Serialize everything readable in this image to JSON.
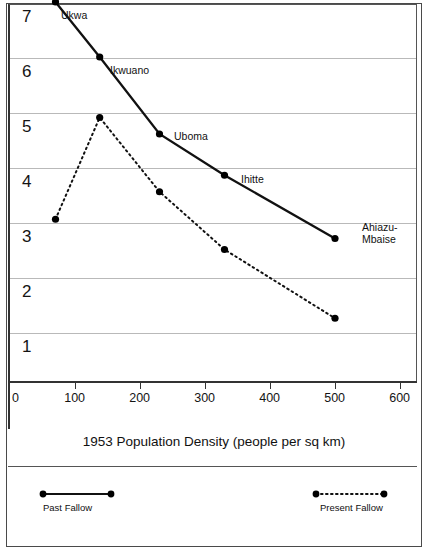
{
  "chart_data": {
    "type": "line",
    "title": "",
    "xlabel": "1953 Population Density  (people per sq km)",
    "ylabel": "",
    "xlim": [
      0,
      600
    ],
    "ylim": [
      0,
      7.3
    ],
    "xticks": [
      0,
      100,
      200,
      300,
      400,
      500,
      600
    ],
    "yticks": [
      1,
      2,
      3,
      4,
      5,
      6,
      7
    ],
    "grid": "horizontal",
    "legend_position": "bottom",
    "x": [
      70,
      138,
      230,
      330,
      500
    ],
    "point_labels": [
      "Ukwa",
      "Ikwuano",
      "Uboma",
      "Ihitte",
      "Ahiazu-\nMbaise"
    ],
    "series": [
      {
        "name": "Past Fallow",
        "style": "solid",
        "values": [
          7.0,
          6.0,
          4.6,
          3.85,
          2.7
        ]
      },
      {
        "name": "Present Fallow",
        "style": "dotted",
        "values": [
          3.05,
          4.9,
          3.55,
          2.5,
          1.25
        ]
      }
    ]
  },
  "axis": {
    "x_title": "1953 Population Density  (people per sq km)",
    "x_tick_labels": [
      "0",
      "100",
      "200",
      "300",
      "400",
      "500",
      "600"
    ],
    "y_tick_labels": [
      "1",
      "2",
      "3",
      "4",
      "5",
      "6",
      "7"
    ]
  },
  "annotations": {
    "ukwa": "Ukwa",
    "ikwuano": "Ikwuano",
    "uboma": "Uboma",
    "ihitte": "Ihitte",
    "ahiazu_line1": "Ahiazu-",
    "ahiazu_line2": "Mbaise"
  },
  "legend": {
    "past_fallow": "Past Fallow",
    "present_fallow": "Present Fallow"
  },
  "colors": {
    "line": "#111111",
    "marker": "#000000",
    "grid": "#b9b9b9",
    "axis": "#333333",
    "border": "#4a4a4a",
    "background": "#ffffff"
  }
}
